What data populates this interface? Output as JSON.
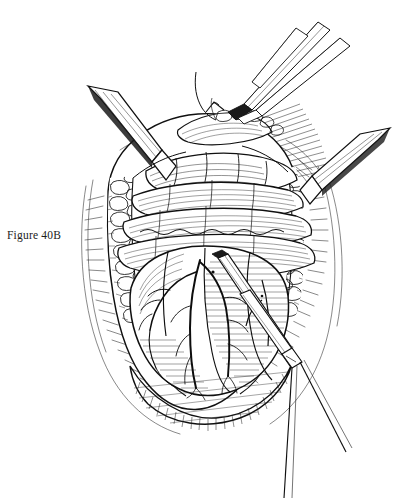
{
  "figure": {
    "caption": "Figure 40B",
    "caption_position": {
      "x": 7,
      "y": 229
    },
    "medium": "pen-and-ink line engraving",
    "canvas": {
      "width": 396,
      "height": 499
    },
    "colors": {
      "ink": "#111111",
      "line": "#1a1a1a",
      "hatch": "#2b2b2b",
      "paper": "#ffffff",
      "fill": "#ffffff"
    },
    "elements": {
      "wound_opening": "large oval surgical opening occupying the center of the plate",
      "wound_edge_left": "lobulated subcutaneous fat margin with stippled globules",
      "wound_edge_right": "lobulated subcutaneous fat margin with stippled globules",
      "wound_edge_bottom": "cross-hatched cut tissue margin along the inferior rim",
      "fascial_bands": "four horizontal muscle and fascia bands spanning the upper wound",
      "organ_surface": "rounded organ exposed in the lower wound with fine horizontal shading",
      "vessels": "branching dendritic vessel tree across the left organ surface",
      "suture_thread": "fine curved suture loop rising from the wound apex"
    },
    "instruments": [
      {
        "name": "retractor-blade-left",
        "label": "Retractor blade",
        "entry": "upper left"
      },
      {
        "name": "retractor-blade-right",
        "label": "Retractor blade",
        "entry": "upper right"
      },
      {
        "name": "forceps-upper",
        "label": "Forceps",
        "entry": "top, grasping apex tissue"
      },
      {
        "name": "forceps-lower",
        "label": "Dissecting forceps",
        "entry": "lower right, tip at organ"
      },
      {
        "name": "needle-holder",
        "label": "Needle holder",
        "entry": "top right corner"
      }
    ],
    "hatching": {
      "fascia_band_count": 4,
      "vessel_branch_count": 14,
      "fat_globule_count": 44
    }
  }
}
